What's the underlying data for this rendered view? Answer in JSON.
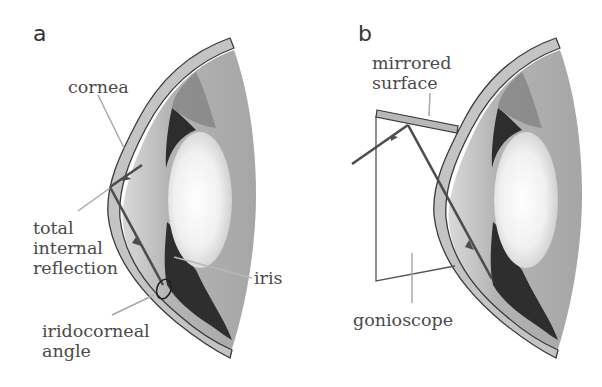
{
  "figure": {
    "panels": [
      {
        "id": "a",
        "letter": "a",
        "labels": {
          "cornea": "cornea",
          "tir_line1": "total",
          "tir_line2": "internal",
          "tir_line3": "reflection",
          "iris": "iris",
          "angle_line1": "iridocorneal",
          "angle_line2": "angle"
        }
      },
      {
        "id": "b",
        "letter": "b",
        "labels": {
          "mirror_line1": "mirrored",
          "mirror_line2": "surface",
          "gonioscope": "gonioscope"
        }
      }
    ],
    "colors": {
      "cornea_fill": "#c4c4c4",
      "outline": "#3a3a3a",
      "ray": "#4d4d4d",
      "leader": "#a8a8a8",
      "sclera": "#a9a9a9",
      "iris_dark": "#1e1e1e",
      "lens": "#f4f4f4"
    }
  }
}
